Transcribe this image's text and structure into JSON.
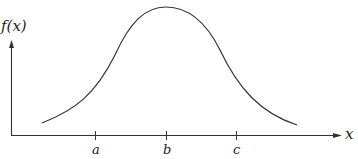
{
  "figure": {
    "y_axis_label": "f(x)",
    "x_axis_label": "x",
    "ticks": [
      {
        "label": "a",
        "x": 95
      },
      {
        "label": "b",
        "x": 166
      },
      {
        "label": "c",
        "x": 236
      }
    ],
    "curve_description": "bell-shaped curve peaking above b",
    "stroke_color": "#333333"
  }
}
